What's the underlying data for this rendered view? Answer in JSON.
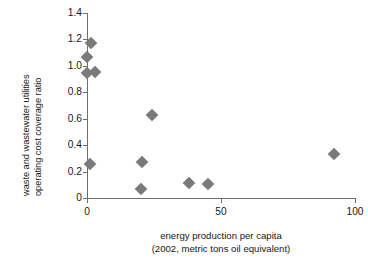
{
  "chart_data": {
    "type": "scatter",
    "title": "",
    "xlabel": "energy production per capita (2002, metric tons oil equivalent)",
    "xlabel_line1": "energy production per capita",
    "xlabel_line2": "(2002, metric tons oil equivalent)",
    "ylabel": "waste and wastewater utilities operating cost coverage ratio",
    "ylabel_line1": "waste and wastewater utilities",
    "ylabel_line2": "operating cost coverage ratio",
    "xlim": [
      0,
      100
    ],
    "ylim": [
      0,
      1.4
    ],
    "xticks": [
      0,
      50,
      100
    ],
    "xtick_labels": [
      "0",
      "50",
      "100"
    ],
    "yticks": [
      0,
      0.2,
      0.4,
      0.6,
      0.8,
      1.0,
      1.2,
      1.4
    ],
    "ytick_labels": [
      "0",
      "0.2",
      "0.4",
      "0.6",
      "0.8",
      "1.0",
      "1.2",
      "1.4"
    ],
    "grid": false,
    "legend": false,
    "marker": "diamond",
    "marker_color": "#7a7a7a",
    "axis_color": "#6e6e6e",
    "series": [
      {
        "name": "countries",
        "points": [
          {
            "x": 1.6,
            "y": 1.17
          },
          {
            "x": 0.0,
            "y": 1.07
          },
          {
            "x": 0.0,
            "y": 0.945
          },
          {
            "x": 3.1,
            "y": 0.95
          },
          {
            "x": 1.3,
            "y": 0.26
          },
          {
            "x": 24.4,
            "y": 0.63
          },
          {
            "x": 20.6,
            "y": 0.27
          },
          {
            "x": 20.3,
            "y": 0.065
          },
          {
            "x": 38.0,
            "y": 0.115
          },
          {
            "x": 45.2,
            "y": 0.105
          },
          {
            "x": 92.0,
            "y": 0.33
          }
        ]
      }
    ]
  }
}
